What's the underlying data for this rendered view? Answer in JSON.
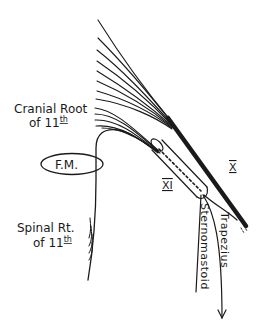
{
  "diagram": {
    "labels": {
      "cranial_root_line1": "Cranial Root",
      "cranial_root_line2": "of 11",
      "cranial_root_sup": "th",
      "foramen_magnum": "F.M.",
      "spinal_root_line1": "Spinal Rt.",
      "spinal_root_line2": "of 11",
      "spinal_root_sup": "th",
      "vagus_numeral": "X",
      "accessory_numeral": "XI",
      "sternomastoid": "Sternomastoid",
      "trapezius": "Trapezius"
    },
    "colors": {
      "ink": "#1a1a1a",
      "background": "#ffffff"
    }
  }
}
